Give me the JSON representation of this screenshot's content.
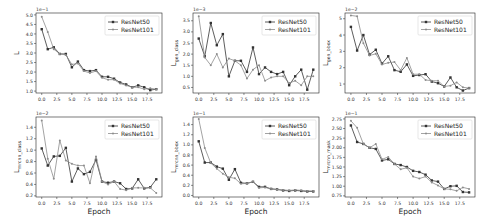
{
  "figure": {
    "xlabel_shared": "Epoch"
  },
  "legend": {
    "series": [
      "ResNet50",
      "ResNet101"
    ]
  },
  "colors": {
    "resnet50": "#333333",
    "resnet101": "#8c8c8c",
    "axis": "#222222"
  },
  "chart_data": [
    {
      "type": "line",
      "ylabel": "L",
      "ylabel_sub": "",
      "scale_label": "1e−1",
      "xlabel": "",
      "x": [
        0,
        1,
        2,
        3,
        4,
        5,
        6,
        7,
        8,
        9,
        10,
        11,
        12,
        13,
        14,
        15,
        16,
        17,
        18,
        19
      ],
      "xticks": [
        "0.0",
        "2.5",
        "5.0",
        "7.5",
        "10.0",
        "12.5",
        "15.0",
        "17.5"
      ],
      "yticks": [
        1.0,
        1.5,
        2.0,
        2.5,
        3.0,
        3.5,
        4.0,
        4.5,
        5.0
      ],
      "ylim": [
        0.9,
        5.1
      ],
      "series": [
        {
          "name": "ResNet50",
          "values": [
            4.25,
            3.2,
            3.3,
            2.95,
            2.95,
            2.25,
            2.55,
            2.1,
            2.05,
            2.1,
            1.75,
            1.75,
            1.65,
            1.45,
            1.35,
            1.2,
            1.3,
            1.2,
            1.05,
            1.1
          ]
        },
        {
          "name": "ResNet101",
          "values": [
            4.9,
            4.1,
            3.2,
            2.95,
            2.9,
            2.4,
            2.45,
            2.05,
            1.95,
            2.05,
            1.7,
            1.6,
            1.6,
            1.4,
            1.3,
            1.2,
            1.2,
            1.1,
            1.15,
            1.1
          ]
        }
      ]
    },
    {
      "type": "line",
      "ylabel": "L",
      "ylabel_sub": "gen_class",
      "scale_label": "1e−3",
      "xlabel": "",
      "x": [
        0,
        1,
        2,
        3,
        4,
        5,
        6,
        7,
        8,
        9,
        10,
        11,
        12,
        13,
        14,
        15,
        16,
        17,
        18,
        19
      ],
      "xticks": [
        "0.0",
        "2.5",
        "5.0",
        "7.5",
        "10.0",
        "12.5",
        "15.0",
        "17.5"
      ],
      "yticks": [
        0.5,
        1.0,
        1.5,
        2.0,
        2.5,
        3.0,
        3.5
      ],
      "ylim": [
        0.25,
        3.85
      ],
      "series": [
        {
          "name": "ResNet50",
          "values": [
            2.7,
            1.9,
            3.4,
            2.4,
            2.9,
            1.0,
            1.7,
            1.7,
            1.2,
            2.3,
            1.1,
            1.4,
            1.2,
            1.1,
            1.2,
            0.6,
            1.0,
            1.3,
            0.4,
            1.3
          ]
        },
        {
          "name": "ResNet101",
          "values": [
            3.7,
            1.85,
            1.5,
            2.0,
            1.4,
            1.8,
            1.7,
            1.5,
            0.9,
            1.3,
            1.5,
            0.8,
            0.95,
            1.0,
            1.0,
            0.7,
            0.8,
            0.6,
            1.0,
            1.0
          ]
        }
      ]
    },
    {
      "type": "line",
      "ylabel": "L",
      "ylabel_sub": "gen_bbox",
      "scale_label": "1e−2",
      "xlabel": "",
      "x": [
        0,
        1,
        2,
        3,
        4,
        5,
        6,
        7,
        8,
        9,
        10,
        11,
        12,
        13,
        14,
        15,
        16,
        17,
        18,
        19
      ],
      "xticks": [
        "0.0",
        "2.5",
        "5.0",
        "7.5",
        "10.0",
        "12.5",
        "15.0",
        "17.5"
      ],
      "yticks": [
        1,
        2,
        3,
        4,
        5
      ],
      "ylim": [
        0.45,
        5.35
      ],
      "series": [
        {
          "name": "ResNet50",
          "values": [
            4.5,
            3.05,
            4.0,
            2.8,
            3.1,
            2.25,
            2.7,
            1.85,
            1.75,
            2.2,
            1.5,
            1.55,
            1.6,
            1.15,
            1.05,
            0.85,
            1.4,
            0.8,
            0.6,
            0.75
          ]
        },
        {
          "name": "ResNet101",
          "values": [
            5.2,
            5.15,
            3.5,
            2.75,
            2.85,
            2.2,
            2.3,
            2.35,
            1.85,
            2.6,
            1.6,
            1.6,
            1.25,
            1.2,
            1.2,
            0.85,
            0.9,
            1.1,
            0.8,
            0.75
          ]
        }
      ]
    },
    {
      "type": "line",
      "ylabel": "L",
      "ylabel_sub": "mrcnn_class",
      "scale_label": "1e−2",
      "xlabel": "Epoch",
      "x": [
        0,
        1,
        2,
        3,
        4,
        5,
        6,
        7,
        8,
        9,
        10,
        11,
        12,
        13,
        14,
        15,
        16,
        17,
        18,
        19
      ],
      "xticks": [
        "0.0",
        "2.5",
        "5.0",
        "7.5",
        "10.0",
        "12.5",
        "15.0",
        "17.5"
      ],
      "yticks": [
        0.2,
        0.4,
        0.6,
        0.8,
        1.0,
        1.2,
        1.4
      ],
      "ylim": [
        0.18,
        1.58
      ],
      "series": [
        {
          "name": "ResNet50",
          "values": [
            1.03,
            0.73,
            0.89,
            0.9,
            1.04,
            0.45,
            0.68,
            0.58,
            0.62,
            0.83,
            0.45,
            0.43,
            0.45,
            0.42,
            0.32,
            0.33,
            0.49,
            0.33,
            0.35,
            0.49
          ]
        },
        {
          "name": "ResNet101",
          "values": [
            1.52,
            0.85,
            0.5,
            1.17,
            0.82,
            0.76,
            0.73,
            0.73,
            0.42,
            0.89,
            0.45,
            0.4,
            0.45,
            0.32,
            0.3,
            0.34,
            0.34,
            0.34,
            0.34,
            0.25
          ]
        }
      ]
    },
    {
      "type": "line",
      "ylabel": "L",
      "ylabel_sub": "mrcnn_bbox",
      "scale_label": "1e−1",
      "xlabel": "Epoch",
      "x": [
        0,
        1,
        2,
        3,
        4,
        5,
        6,
        7,
        8,
        9,
        10,
        11,
        12,
        13,
        14,
        15,
        16,
        17,
        18,
        19
      ],
      "xticks": [
        "0.0",
        "2.5",
        "5.0",
        "7.5",
        "10.0",
        "12.5",
        "15.0",
        "17.5"
      ],
      "yticks": [
        0.0,
        0.2,
        0.4,
        0.6,
        0.8,
        1.0,
        1.2,
        1.4
      ],
      "ylim": [
        -0.03,
        1.55
      ],
      "series": [
        {
          "name": "ResNet50",
          "values": [
            1.07,
            0.65,
            0.65,
            0.57,
            0.53,
            0.31,
            0.52,
            0.25,
            0.24,
            0.27,
            0.17,
            0.17,
            0.13,
            0.12,
            0.1,
            0.09,
            0.1,
            0.09,
            0.08,
            0.08
          ]
        },
        {
          "name": "ResNet101",
          "values": [
            1.51,
            0.94,
            0.64,
            0.53,
            0.43,
            0.36,
            0.34,
            0.23,
            0.24,
            0.27,
            0.15,
            0.16,
            0.13,
            0.12,
            0.11,
            0.1,
            0.11,
            0.1,
            0.09,
            0.09
          ]
        }
      ]
    },
    {
      "type": "line",
      "ylabel": "L",
      "ylabel_sub": "mrcnn_mask",
      "scale_label": "1e−1",
      "xlabel": "Epoch",
      "x": [
        0,
        1,
        2,
        3,
        4,
        5,
        6,
        7,
        8,
        9,
        10,
        11,
        12,
        13,
        14,
        15,
        16,
        17,
        18,
        19
      ],
      "xticks": [
        "0.0",
        "2.5",
        "5.0",
        "7.5",
        "10.0",
        "12.5",
        "15.0",
        "17.5"
      ],
      "yticks": [
        0.75,
        1.0,
        1.25,
        1.5,
        1.75,
        2.0,
        2.25,
        2.5,
        2.75
      ],
      "ylim": [
        0.72,
        2.8
      ],
      "series": [
        {
          "name": "ResNet50",
          "values": [
            2.58,
            2.15,
            2.1,
            2.0,
            1.97,
            1.67,
            1.7,
            1.58,
            1.55,
            1.5,
            1.4,
            1.37,
            1.3,
            1.15,
            1.12,
            0.93,
            1.0,
            1.01,
            0.85,
            0.84
          ]
        },
        {
          "name": "ResNet101",
          "values": [
            2.7,
            2.52,
            2.1,
            2.0,
            2.1,
            1.7,
            1.76,
            1.58,
            1.44,
            1.48,
            1.25,
            1.2,
            1.25,
            1.1,
            1.02,
            0.93,
            0.92,
            0.88,
            0.97,
            0.93
          ]
        }
      ]
    }
  ]
}
